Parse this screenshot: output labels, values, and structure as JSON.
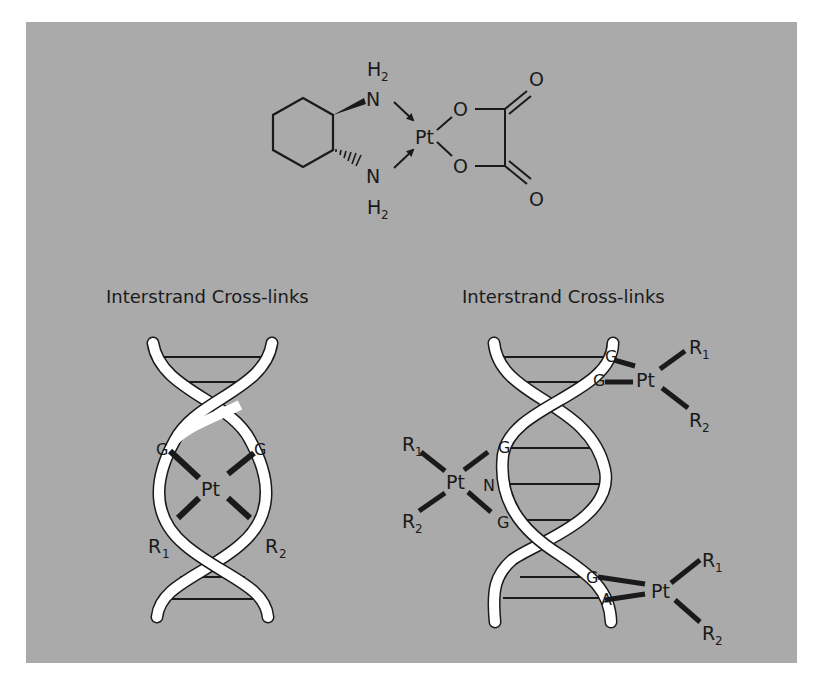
{
  "figure": {
    "background_color": "#aaaaaa",
    "molecule": {
      "name_shown": "",
      "atoms": {
        "amine_top": "N",
        "amine_top_h": "H",
        "amine_top_h_sub": "2",
        "amine_bottom": "N",
        "amine_bottom_h": "H",
        "amine_bottom_h_sub": "2",
        "metal": "Pt",
        "oxygen_ring_top": "O",
        "oxygen_ring_bottom": "O",
        "oxygen_carbonyl_top": "O",
        "oxygen_carbonyl_bottom": "O"
      }
    },
    "left_panel": {
      "title": "Interstrand Cross-links",
      "bases": [
        "G",
        "G"
      ],
      "metal": "Pt",
      "r1": "R",
      "r1_sub": "1",
      "r2": "R",
      "r2_sub": "2"
    },
    "right_panel": {
      "title": "Interstrand Cross-links",
      "top_adduct": {
        "bases": [
          "G",
          "G"
        ],
        "metal": "Pt",
        "r1": "R",
        "r1_sub": "1",
        "r2": "R",
        "r2_sub": "2"
      },
      "middle_adduct": {
        "bases": [
          "G",
          "N",
          "G"
        ],
        "metal": "Pt",
        "r1": "R",
        "r1_sub": "1",
        "r2": "R",
        "r2_sub": "2"
      },
      "bottom_adduct": {
        "bases": [
          "G",
          "A"
        ],
        "metal": "Pt",
        "r1": "R",
        "r1_sub": "1",
        "r2": "R",
        "r2_sub": "2"
      }
    }
  }
}
